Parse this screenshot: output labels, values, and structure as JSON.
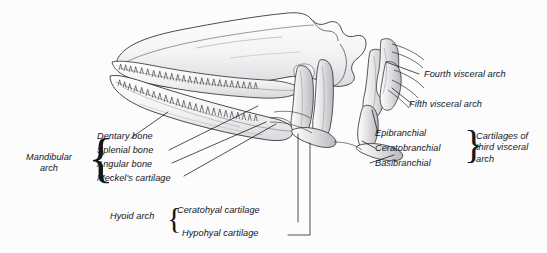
{
  "figure": {
    "background_color": "#fcfcfd",
    "ink_color": "#14161a",
    "width": 547,
    "height": 253
  },
  "labels": {
    "mandibular_arch": "Mandibular\narch",
    "dentary_bone": "Dentary bone",
    "splenial_bone": "Splenial bone",
    "angular_bone": "Angular bone",
    "meckels_cartilage": "Meckel's cartilage",
    "hyoid_arch": "Hyoid arch",
    "ceratohyal_cartilage": "Ceratohyal cartilage",
    "hypohyal_cartilage": "Hypohyal cartilage",
    "fourth_visceral_arch": "Fourth visceral arch",
    "fifth_visceral_arch": "Fifth visceral arch",
    "epibranchial": "Epibranchial",
    "ceratobranchial": "Ceratobranchial",
    "basibranchial": "Basibranchial",
    "cartilages_third_arch": "Cartilages of\nthird visceral\narch"
  },
  "braces": {
    "mandibular": "{",
    "hyoid": "{",
    "third_arch": "}"
  }
}
